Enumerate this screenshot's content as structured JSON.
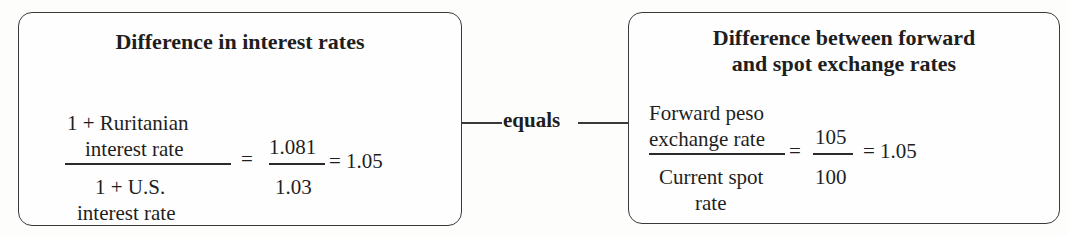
{
  "left_box": {
    "title": "Difference in interest rates",
    "numerator_line1": "1 + Ruritanian",
    "numerator_line2": "interest rate",
    "denominator_line1": "1 + U.S.",
    "denominator_line2": "interest rate",
    "eq1": "=",
    "frac_num": "1.081",
    "frac_den": "1.03",
    "eq2": "= 1.05"
  },
  "connector": {
    "label": "equals"
  },
  "right_box": {
    "title_line1": "Difference between forward",
    "title_line2": "and spot exchange rates",
    "numerator_line1": "Forward peso",
    "numerator_line2": "exchange rate",
    "denominator_line1": "Current spot",
    "denominator_line2": "rate",
    "eq1": "=",
    "frac_num": "105",
    "frac_den": "100",
    "eq2": "= 1.05"
  }
}
